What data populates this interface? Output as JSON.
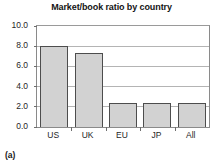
{
  "figure": {
    "panel_caption": "(a)"
  },
  "chart_data": {
    "type": "bar",
    "title": "Market/book ratio by country",
    "xlabel": "",
    "ylabel": "",
    "categories": [
      "US",
      "UK",
      "EU",
      "JP",
      "All"
    ],
    "values": [
      8.0,
      7.3,
      2.4,
      2.4,
      2.4
    ],
    "ylim": [
      0.0,
      10.0
    ],
    "yticks": [
      0.0,
      2.0,
      4.0,
      6.0,
      8.0,
      10.0
    ],
    "ytick_labels": [
      "0.0",
      "2.0",
      "4.0",
      "6.0",
      "8.0",
      "10.0"
    ],
    "grid": true,
    "legend": null,
    "bar_fill_color": "#d2d2d2",
    "bar_edge_color": "#4d4d4d",
    "gridline_color": "#b4b4b4",
    "axis_color": "#8a8a8a",
    "background_color": "#ffffff"
  }
}
